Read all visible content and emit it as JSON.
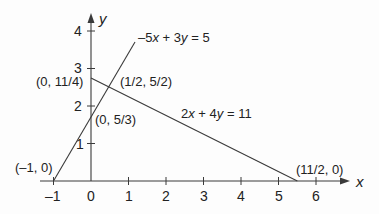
{
  "diagram": {
    "type": "linear-equations-graph",
    "axes": {
      "x_label": "x",
      "y_label": "y",
      "x_ticks": [
        "–1",
        "0",
        "1",
        "2",
        "3",
        "4",
        "5",
        "6"
      ],
      "y_ticks": [
        "1",
        "2",
        "3",
        "4"
      ]
    },
    "lines": [
      {
        "equation": "–5x + 3y = 5",
        "from": [
          -1,
          0
        ],
        "to": [
          1.17,
          3.62
        ]
      },
      {
        "equation": "2x + 4y = 11",
        "from": [
          0,
          2.75
        ],
        "to": [
          5.5,
          0
        ]
      }
    ],
    "points": [
      {
        "label": "(–1, 0)",
        "x": -1,
        "y": 0
      },
      {
        "label": "(0, 11/4)",
        "x": 0,
        "y": 2.75
      },
      {
        "label": "(1/2, 5/2)",
        "x": 0.5,
        "y": 2.5
      },
      {
        "label": "(0, 5/3)",
        "x": 0,
        "y": 1.6667
      },
      {
        "label": "(11/2, 0)",
        "x": 5.5,
        "y": 0
      }
    ],
    "colors": {
      "line": "#3a3a3a",
      "text": "#222222",
      "background": "#fdfdfd"
    }
  }
}
